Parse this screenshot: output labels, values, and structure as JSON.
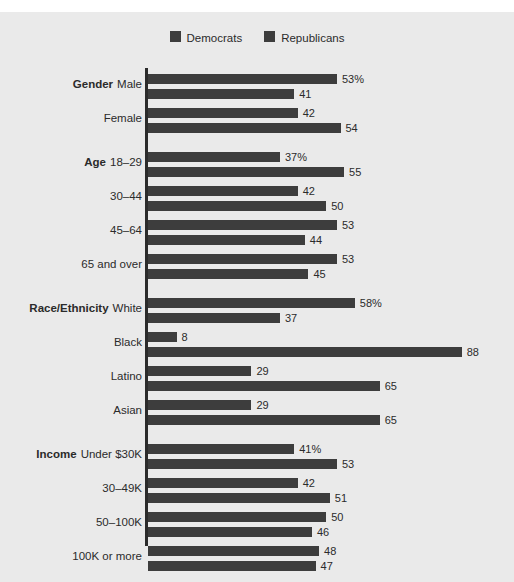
{
  "legend": {
    "items": [
      {
        "label": "Democrats",
        "color": "#3d3d3d",
        "icon": "legend-swatch-icon"
      },
      {
        "label": "Republicans",
        "color": "#3d3d3d",
        "icon": "legend-swatch-icon"
      }
    ]
  },
  "colors": {
    "background": "#eaeaea",
    "page": "#ffffff",
    "bar": "#3d3d3d",
    "text": "#2b2b2b",
    "axis": "#2b2b2b"
  },
  "chart_data": {
    "type": "bar",
    "orientation": "horizontal",
    "title": "",
    "subtitle": "",
    "xlabel": "",
    "ylabel": "",
    "xlim": [
      0,
      100
    ],
    "grid": false,
    "legend_position": "top-center",
    "value_suffix_first_row": "%",
    "series": [
      {
        "name": "Democrats",
        "color": "#3d3d3d"
      },
      {
        "name": "Republicans",
        "color": "#3d3d3d"
      }
    ],
    "groups": [
      {
        "name": "Gender",
        "rows": [
          {
            "group_label": "Gender",
            "label": "Male",
            "values": [
              53,
              41
            ],
            "display": [
              "53%",
              "41"
            ]
          },
          {
            "group_label": "",
            "label": "Female",
            "values": [
              42,
              54
            ],
            "display": [
              "42",
              "54"
            ]
          }
        ]
      },
      {
        "name": "Age",
        "rows": [
          {
            "group_label": "Age",
            "label": "18–29",
            "values": [
              37,
              55
            ],
            "display": [
              "37%",
              "55"
            ]
          },
          {
            "group_label": "",
            "label": "30–44",
            "values": [
              42,
              50
            ],
            "display": [
              "42",
              "50"
            ]
          },
          {
            "group_label": "",
            "label": "45–64",
            "values": [
              53,
              44
            ],
            "display": [
              "53",
              "44"
            ]
          },
          {
            "group_label": "",
            "label": "65 and over",
            "values": [
              53,
              45
            ],
            "display": [
              "53",
              "45"
            ]
          }
        ]
      },
      {
        "name": "Race/Ethnicity",
        "rows": [
          {
            "group_label": "Race/Ethnicity",
            "label": "White",
            "values": [
              58,
              37
            ],
            "display": [
              "58%",
              "37"
            ]
          },
          {
            "group_label": "",
            "label": "Black",
            "values": [
              8,
              88
            ],
            "display": [
              "8",
              "88"
            ]
          },
          {
            "group_label": "",
            "label": "Latino",
            "values": [
              29,
              65
            ],
            "display": [
              "29",
              "65"
            ]
          },
          {
            "group_label": "",
            "label": "Asian",
            "values": [
              29,
              65
            ],
            "display": [
              "29",
              "65"
            ]
          }
        ]
      },
      {
        "name": "Income",
        "rows": [
          {
            "group_label": "Income",
            "label": "Under $30K",
            "values": [
              41,
              53
            ],
            "display": [
              "41%",
              "53"
            ]
          },
          {
            "group_label": "",
            "label": "30–49K",
            "values": [
              42,
              51
            ],
            "display": [
              "42",
              "51"
            ]
          },
          {
            "group_label": "",
            "label": "50–100K",
            "values": [
              50,
              46
            ],
            "display": [
              "50",
              "46"
            ]
          },
          {
            "group_label": "",
            "label": "100K or more",
            "values": [
              48,
              47
            ],
            "display": [
              "48",
              "47"
            ]
          }
        ]
      }
    ]
  }
}
